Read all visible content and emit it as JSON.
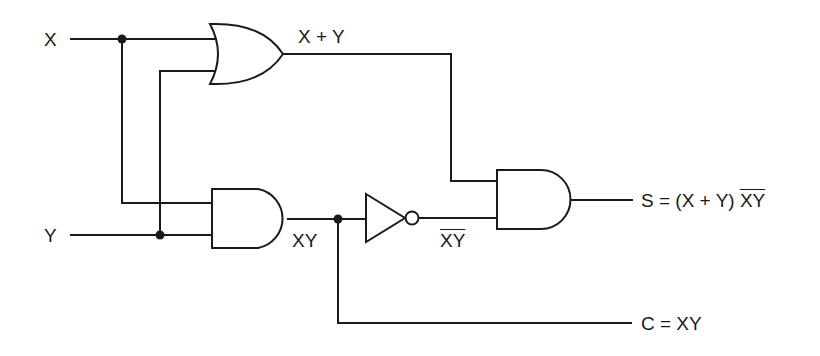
{
  "diagram": {
    "inputs": [
      {
        "id": "x",
        "label": "X"
      },
      {
        "id": "y",
        "label": "Y"
      }
    ],
    "gates": [
      {
        "id": "or1",
        "type": "OR",
        "output_label": "X + Y"
      },
      {
        "id": "and1",
        "type": "AND",
        "output_label": "XY"
      },
      {
        "id": "not1",
        "type": "NOT",
        "output_label": "XY",
        "output_label_overbar": true
      },
      {
        "id": "and2",
        "type": "AND"
      }
    ],
    "outputs": [
      {
        "id": "s",
        "label_prefix": "S = (X + Y) ",
        "label_overbar": "XY"
      },
      {
        "id": "c",
        "label": "C = XY"
      }
    ],
    "colors": {
      "line": "#1a1a1a",
      "background": "#ffffff"
    }
  }
}
